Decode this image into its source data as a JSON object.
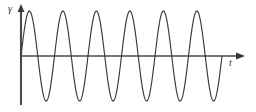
{
  "figure": {
    "name": "sinusoidal-waveform-plot",
    "background_color": "#ffffff",
    "stroke_color": "#3a3a3a",
    "width": 256,
    "height": 112
  },
  "axes": {
    "y_axis": {
      "label": "γ",
      "label_name": "gamma",
      "x_position": 21,
      "top": 6,
      "bottom": 105,
      "has_arrow": true,
      "arrow_direction": "up"
    },
    "x_axis": {
      "label": "t",
      "label_name": "time",
      "y_position": 56,
      "left": 21,
      "right": 243,
      "has_arrow": true,
      "arrow_direction": "right"
    }
  },
  "chart_data": {
    "type": "line",
    "title": "",
    "xlabel": "t",
    "ylabel": "γ",
    "grid": false,
    "legend": null,
    "curve": {
      "name": "sine-wave",
      "function": "y = A*sin(2*pi*t/T)",
      "amplitude_px": 45,
      "period_px": 33.5,
      "cycles": 6,
      "phase": 0,
      "damped": false,
      "start_x_px": 21,
      "end_x_px": 222,
      "baseline_y_px": 56,
      "peak_y_px": 11,
      "trough_y_px": 101,
      "peaks_x_px": [
        29,
        62,
        96,
        129,
        163,
        196
      ],
      "troughs_x_px": [
        46,
        79,
        113,
        146,
        180,
        213
      ],
      "zero_crossings_x_px": [
        21,
        38,
        54,
        71,
        88,
        105,
        121,
        138,
        155,
        172,
        188,
        205,
        222
      ]
    },
    "xlim": [
      0,
      256
    ],
    "ylim": [
      0,
      112
    ]
  }
}
